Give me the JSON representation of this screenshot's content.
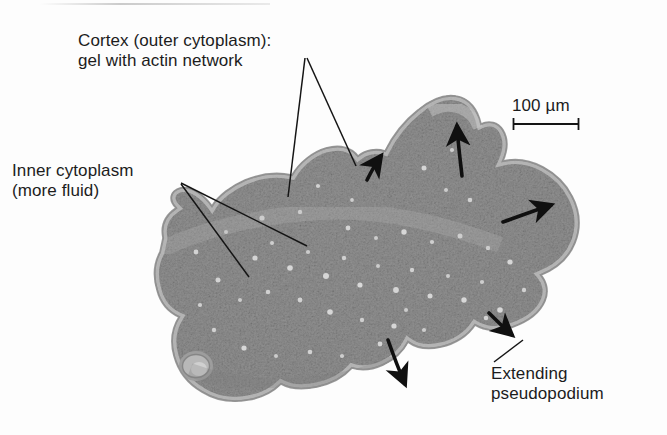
{
  "figure": {
    "background_color": "#fdfdfd",
    "cell_fill_color": "#a8a8a8",
    "cell_edge_color": "#8d8d8d",
    "ink_color": "#1c1c1c"
  },
  "labels": {
    "cortex": {
      "line1": "Cortex (outer cytoplasm):",
      "line2": "gel with actin network"
    },
    "inner_cytoplasm": {
      "line1": "Inner cytoplasm",
      "line2": "(more fluid)"
    },
    "pseudopodium": {
      "line1": "Extending",
      "line2": "pseudopodium"
    }
  },
  "scale_bar": {
    "value": "100",
    "unit": "µm",
    "text": "100 µm",
    "bar_length_px": 66
  },
  "annotations": {
    "leader_lines": [
      {
        "name": "cortex-leader-left",
        "from": [
          305,
          58
        ],
        "to": [
          288,
          197
        ]
      },
      {
        "name": "cortex-leader-right",
        "from": [
          307,
          58
        ],
        "to": [
          356,
          166
        ]
      },
      {
        "name": "inner-leader-upper",
        "from": [
          181,
          183
        ],
        "to": [
          307,
          246
        ]
      },
      {
        "name": "inner-leader-lower",
        "from": [
          181,
          184
        ],
        "to": [
          249,
          277
        ]
      },
      {
        "name": "pseudopodium-leader",
        "from": [
          494,
          362
        ],
        "to": [
          523,
          340
        ]
      }
    ],
    "motion_arrows": [
      {
        "name": "arrow-upleft-small-pseudopod",
        "direction": "up-left"
      },
      {
        "name": "arrow-up-top-pseudopod",
        "direction": "up"
      },
      {
        "name": "arrow-right-lobe",
        "direction": "right"
      },
      {
        "name": "arrow-downright-pseudopod",
        "direction": "down-right"
      },
      {
        "name": "arrow-down-bottom-pseudopod",
        "direction": "down"
      }
    ]
  }
}
